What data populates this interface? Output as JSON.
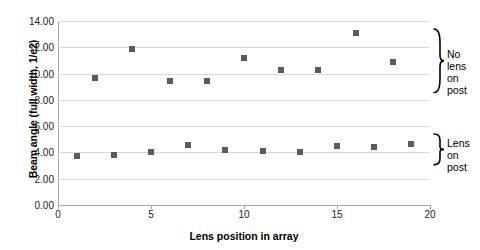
{
  "chart_data": {
    "type": "scatter",
    "title": "",
    "xlabel": "Lens position in array",
    "ylabel": "Beam angle (full width, 1/e2)",
    "xlim": [
      0,
      20
    ],
    "ylim": [
      0,
      14
    ],
    "grid": true,
    "legend_position": "right-braces",
    "x_ticks": [
      "0",
      "5",
      "10",
      "15",
      "20"
    ],
    "x_tick_values": [
      0,
      5,
      10,
      15,
      20
    ],
    "y_ticks": [
      "0.00",
      "2.00",
      "4.00",
      "6.00",
      "8.00",
      "10.00",
      "12.00",
      "14.00"
    ],
    "y_tick_values": [
      0,
      2,
      4,
      6,
      8,
      10,
      12,
      14
    ],
    "series": [
      {
        "name": "No lens on post",
        "marker": "square",
        "color": "#5b5b5b",
        "points": [
          {
            "x": 2,
            "y": 9.7
          },
          {
            "x": 4,
            "y": 11.9
          },
          {
            "x": 6,
            "y": 9.45
          },
          {
            "x": 8,
            "y": 9.4
          },
          {
            "x": 10,
            "y": 11.15
          },
          {
            "x": 12,
            "y": 10.3
          },
          {
            "x": 14,
            "y": 10.25
          },
          {
            "x": 16,
            "y": 13.1
          },
          {
            "x": 18,
            "y": 10.9
          }
        ]
      },
      {
        "name": "Lens on post",
        "marker": "square",
        "color": "#5b5b5b",
        "points": [
          {
            "x": 1,
            "y": 3.75
          },
          {
            "x": 3,
            "y": 3.8
          },
          {
            "x": 5,
            "y": 4.05
          },
          {
            "x": 7,
            "y": 4.6
          },
          {
            "x": 9,
            "y": 4.2
          },
          {
            "x": 11,
            "y": 4.1
          },
          {
            "x": 13,
            "y": 4.05
          },
          {
            "x": 15,
            "y": 4.5
          },
          {
            "x": 17,
            "y": 4.4
          },
          {
            "x": 19,
            "y": 4.65
          }
        ]
      }
    ],
    "annotations": [
      {
        "name": "no-lens-on-post",
        "text": "No lens\non post",
        "y_range": [
          8.5,
          13.5
        ]
      },
      {
        "name": "lens-on-post",
        "text": "Lens on\npost",
        "y_range": [
          3.0,
          5.5
        ]
      }
    ]
  },
  "colors": {
    "marker": "#5b5b5b",
    "gridline": "#d9d9d9",
    "axis": "#a6a6a6",
    "text": "#000000",
    "background": "#ffffff"
  }
}
